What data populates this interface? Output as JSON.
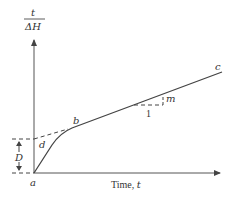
{
  "diagram": {
    "y_axis_label": {
      "numerator": "t",
      "denominator": "ΔH"
    },
    "x_axis_label": "Time, t",
    "x_axis_label_text": "Time, ",
    "x_axis_label_var": "t",
    "points": {
      "a": "a",
      "b": "b",
      "c": "c",
      "d": "d"
    },
    "intercept_label": "D",
    "slope_label": "m",
    "slope_run_label": "1",
    "colors": {
      "line": "#444444",
      "axis": "#555555",
      "text": "#333333"
    }
  }
}
